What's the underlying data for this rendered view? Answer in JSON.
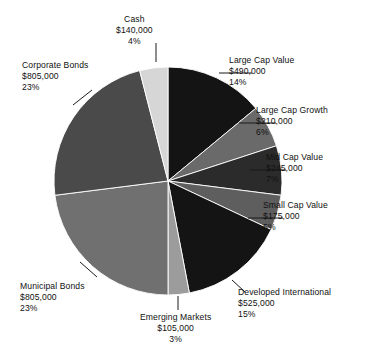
{
  "chart_data": {
    "type": "pie",
    "title": "",
    "subtitle": "",
    "xlabel": "",
    "ylabel": "",
    "legend_position": "none",
    "grid": false,
    "value_prefix": "$",
    "categories": [
      "Large Cap Value",
      "Large Cap Growth",
      "Mid Cap Value",
      "Small Cap Value",
      "Developed International",
      "Emerging Markets",
      "Municipal Bonds",
      "Corporate Bonds",
      "Cash"
    ],
    "values": [
      490000,
      210000,
      245000,
      175000,
      525000,
      105000,
      805000,
      805000,
      140000
    ],
    "percents": [
      14,
      6,
      7,
      5,
      15,
      3,
      23,
      23,
      4
    ],
    "colors": [
      "#141414",
      "#6a6a6a",
      "#2b2b2b",
      "#5e5e5e",
      "#141414",
      "#9c9c9c",
      "#707070",
      "#4a4a4a",
      "#d6d6d6"
    ],
    "slices": [
      {
        "name": "Large Cap Value",
        "value_label": "$490,000",
        "percent_label": "14%",
        "value": 490000,
        "percent": 14,
        "color": "#141414"
      },
      {
        "name": "Large Cap Growth",
        "value_label": "$210,000",
        "percent_label": "6%",
        "value": 210000,
        "percent": 6,
        "color": "#6a6a6a"
      },
      {
        "name": "Mid Cap Value",
        "value_label": "$245,000",
        "percent_label": "7%",
        "value": 245000,
        "percent": 7,
        "color": "#2b2b2b"
      },
      {
        "name": "Small Cap Value",
        "value_label": "$175,000",
        "percent_label": "5%",
        "value": 175000,
        "percent": 5,
        "color": "#5e5e5e"
      },
      {
        "name": "Developed International",
        "value_label": "$525,000",
        "percent_label": "15%",
        "value": 525000,
        "percent": 15,
        "color": "#141414"
      },
      {
        "name": "Emerging Markets",
        "value_label": "$105,000",
        "percent_label": "3%",
        "value": 105000,
        "percent": 3,
        "color": "#9c9c9c"
      },
      {
        "name": "Municipal Bonds",
        "value_label": "$805,000",
        "percent_label": "23%",
        "value": 805000,
        "percent": 23,
        "color": "#707070"
      },
      {
        "name": "Corporate Bonds",
        "value_label": "$805,000",
        "percent_label": "23%",
        "value": 805000,
        "percent": 23,
        "color": "#4a4a4a"
      },
      {
        "name": "Cash",
        "value_label": "$140,000",
        "percent_label": "4%",
        "value": 140000,
        "percent": 4,
        "color": "#d6d6d6"
      }
    ],
    "geometry": {
      "center_x": 168,
      "center_y": 181,
      "radius": 114,
      "start_angle_deg": 0,
      "direction": "clockwise"
    },
    "leader_line_color": "#1a1a1a",
    "background_color": "#ffffff"
  },
  "labels": [
    {
      "key": "large-cap-value",
      "align": "left",
      "x": 229,
      "y": 55,
      "line": {
        "x1": 219,
        "y1": 73,
        "x2": 252,
        "y2": 73
      }
    },
    {
      "key": "large-cap-growth",
      "align": "left",
      "x": 256,
      "y": 105,
      "line": {
        "x1": 239,
        "y1": 123,
        "x2": 276,
        "y2": 123
      }
    },
    {
      "key": "mid-cap-value",
      "align": "left",
      "x": 266,
      "y": 152,
      "line": {
        "x1": 250,
        "y1": 170,
        "x2": 286,
        "y2": 170
      }
    },
    {
      "key": "small-cap-value",
      "align": "left",
      "x": 263,
      "y": 200,
      "line": {
        "x1": 248,
        "y1": 218,
        "x2": 283,
        "y2": 218
      }
    },
    {
      "key": "developed-international",
      "align": "left",
      "x": 238,
      "y": 287,
      "line": {
        "x1": 232,
        "y1": 280,
        "x2": 245,
        "y2": 292
      }
    },
    {
      "key": "emerging-markets",
      "align": "center",
      "x": 140,
      "y": 312,
      "line": {
        "x1": 178,
        "y1": 296,
        "x2": 178,
        "y2": 310
      }
    },
    {
      "key": "municipal-bonds",
      "align": "left",
      "x": 20,
      "y": 281,
      "line": {
        "x1": 80,
        "y1": 262,
        "x2": 97,
        "y2": 277
      }
    },
    {
      "key": "corporate-bonds",
      "align": "left",
      "x": 22,
      "y": 60,
      "line": {
        "x1": 73,
        "y1": 105,
        "x2": 92,
        "y2": 90
      }
    },
    {
      "key": "cash",
      "align": "center",
      "x": 116,
      "y": 14,
      "line": {
        "x1": 156,
        "y1": 43,
        "x2": 156,
        "y2": 62
      }
    }
  ]
}
